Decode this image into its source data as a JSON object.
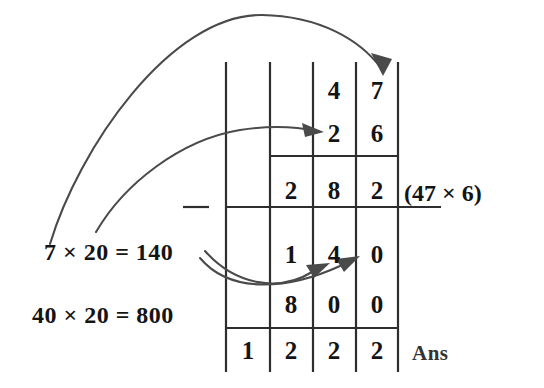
{
  "figure": {
    "ink_color": "#1a1a1a",
    "line_color": "#3b3b3b",
    "background": "#ffffff"
  },
  "grid": {
    "columns": 4,
    "rows": [
      {
        "name": "multiplicand-row",
        "cells": [
          "",
          "",
          "4",
          "7"
        ]
      },
      {
        "name": "multiplier-row",
        "cells": [
          "",
          "",
          "2",
          "6"
        ]
      },
      {
        "name": "partial-product-1",
        "cells": [
          "",
          "2",
          "8",
          "2"
        ]
      },
      {
        "name": "partial-product-2a",
        "cells": [
          "",
          "1",
          "4",
          "0"
        ]
      },
      {
        "name": "partial-product-2b",
        "cells": [
          "",
          "8",
          "0",
          "0"
        ]
      },
      {
        "name": "answer-row",
        "cells": [
          "1",
          "2",
          "2",
          "2"
        ]
      }
    ]
  },
  "annotations": {
    "note_1": "7 × 20 = 140",
    "note_2": "40 × 20 = 800",
    "partial_label": "(47 × 6)",
    "answer_label": "Ans"
  },
  "arrows": [
    {
      "name": "arrow-7-to-units",
      "from": "7 × 20 label",
      "to": "7 digit in multiplicand"
    },
    {
      "name": "arrow-20-to-tens",
      "from": "7 × 20 label",
      "to": "2 digit in multiplier"
    },
    {
      "name": "arrow-140-to-4",
      "from": "140",
      "to": "4 in partial product"
    },
    {
      "name": "arrow-140-to-0",
      "from": "140",
      "to": "0 in partial product"
    }
  ]
}
